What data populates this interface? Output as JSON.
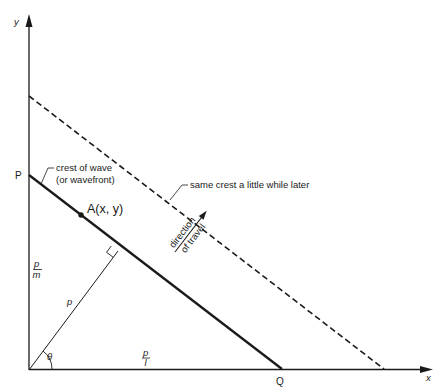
{
  "axes": {
    "x_label": "x",
    "y_label": "y"
  },
  "points": {
    "P": "P",
    "Q": "Q",
    "A": "A(x, y)"
  },
  "annotations": {
    "crest_line1": "crest of wave",
    "crest_line2": "(or wavefront)",
    "later_crest": "same crest a little while later",
    "direction_line1": "direction",
    "direction_line2": "of travel"
  },
  "math_labels": {
    "p": "p",
    "theta": "θ",
    "p_over_m_num": "p",
    "p_over_m_den": "m",
    "p_over_l_num": "p",
    "p_over_l_den": "l"
  },
  "colors": {
    "ink": "#1a1a1a",
    "background": "#ffffff"
  }
}
